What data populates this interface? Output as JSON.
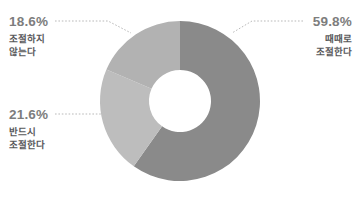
{
  "chart_data": {
    "type": "pie",
    "variant": "donut",
    "title": "",
    "subtitle": "",
    "xlabel": "",
    "ylabel": "",
    "grid": false,
    "legend": "none",
    "value_unit": "%",
    "start_angle_deg": 0,
    "direction": "clockwise",
    "center": {
      "x": 180,
      "y": 101
    },
    "outer_radius": 80,
    "inner_radius": 31,
    "categories": [
      "때때로 조절한다",
      "반드시 조절한다",
      "조절하지 않는다"
    ],
    "values": [
      59.8,
      21.6,
      18.6
    ],
    "slices": [
      {
        "id": "sometimes-adjust",
        "label_lines": [
          "때때로",
          "조절한다"
        ],
        "label": "때때로 조절한다",
        "percent_text": "59.8%",
        "value": 59.8,
        "color": "#8a8a8a",
        "start_deg": 0.0,
        "end_deg": 215.3
      },
      {
        "id": "must-adjust",
        "label_lines": [
          "반드시",
          "조절한다"
        ],
        "label": "반드시 조절한다",
        "percent_text": "21.6%",
        "value": 21.6,
        "color": "#bdbdbd",
        "start_deg": 215.3,
        "end_deg": 293.1
      },
      {
        "id": "not-adjust",
        "label_lines": [
          "조절하지",
          "않는다"
        ],
        "label": "조절하지 않는다",
        "percent_text": "18.6%",
        "value": 18.6,
        "color": "#b2b2b2",
        "start_deg": 293.1,
        "end_deg": 360.0
      }
    ]
  },
  "colors": {
    "background": "#ffffff",
    "percent_text": "#7d7d7d",
    "label_text": "#58585a",
    "leader_line": "#b9b9b9",
    "slice_sometimes": "#8a8a8a",
    "slice_must": "#bdbdbd",
    "slice_not": "#b2b2b2"
  }
}
